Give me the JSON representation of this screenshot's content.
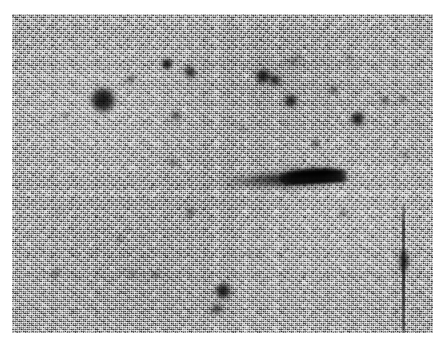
{
  "figure": {
    "kind": "astronomical-photographic-plate",
    "width": 445,
    "height": 348,
    "paper_color": "#ffffff"
  },
  "plate": {
    "left": 12,
    "top": 14,
    "width": 421,
    "height": 319,
    "background_color": "#9a9a9a",
    "grain_dark": "#4f4f4f",
    "grain_light": "#ececec",
    "source_color": "#161616"
  },
  "streak_object": {
    "name": "elongated-dark-object",
    "center_x": 283,
    "center_y": 179,
    "length": 128,
    "height": 26,
    "rotation_deg": -3,
    "core_color": "#0a0a0a"
  },
  "scratch": {
    "name": "plate-scratch",
    "x": 402,
    "top": 203,
    "width": 3,
    "height": 133,
    "knot_y": 58,
    "knot_width": 11,
    "knot_height": 24
  },
  "stars": [
    {
      "id": "star-01",
      "x": 103,
      "y": 100,
      "r": 12.5,
      "darkness": 0.93,
      "blur": 2.2
    },
    {
      "id": "star-02",
      "x": 131,
      "y": 79,
      "r": 4.0,
      "darkness": 0.62,
      "blur": 2.0
    },
    {
      "id": "star-03",
      "x": 167,
      "y": 64,
      "r": 5.6,
      "darkness": 0.88,
      "blur": 1.8
    },
    {
      "id": "star-04",
      "x": 190,
      "y": 72,
      "r": 5.8,
      "darkness": 0.84,
      "blur": 2.0
    },
    {
      "id": "star-05",
      "x": 176,
      "y": 116,
      "r": 4.6,
      "darkness": 0.7,
      "blur": 2.0
    },
    {
      "id": "star-06",
      "x": 263,
      "y": 76,
      "r": 7.4,
      "darkness": 0.92,
      "blur": 2.0
    },
    {
      "id": "star-07",
      "x": 275,
      "y": 80,
      "r": 6.2,
      "darkness": 0.86,
      "blur": 2.2
    },
    {
      "id": "star-08",
      "x": 293,
      "y": 62,
      "r": 3.6,
      "darkness": 0.6,
      "blur": 2.0
    },
    {
      "id": "star-09",
      "x": 291,
      "y": 101,
      "r": 6.6,
      "darkness": 0.88,
      "blur": 2.0
    },
    {
      "id": "star-10",
      "x": 334,
      "y": 90,
      "r": 4.2,
      "darkness": 0.64,
      "blur": 2.2
    },
    {
      "id": "star-11",
      "x": 358,
      "y": 119,
      "r": 7.2,
      "darkness": 0.9,
      "blur": 2.0
    },
    {
      "id": "star-12",
      "x": 385,
      "y": 100,
      "r": 3.8,
      "darkness": 0.62,
      "blur": 2.0
    },
    {
      "id": "star-13",
      "x": 403,
      "y": 99,
      "r": 3.4,
      "darkness": 0.55,
      "blur": 2.2
    },
    {
      "id": "star-14",
      "x": 316,
      "y": 143,
      "r": 3.6,
      "darkness": 0.66,
      "blur": 2.0
    },
    {
      "id": "star-15",
      "x": 406,
      "y": 155,
      "r": 3.2,
      "darkness": 0.58,
      "blur": 2.0
    },
    {
      "id": "star-16",
      "x": 173,
      "y": 163,
      "r": 3.6,
      "darkness": 0.62,
      "blur": 2.0
    },
    {
      "id": "star-17",
      "x": 190,
      "y": 212,
      "r": 4.0,
      "darkness": 0.68,
      "blur": 2.0
    },
    {
      "id": "star-18",
      "x": 343,
      "y": 213,
      "r": 3.4,
      "darkness": 0.58,
      "blur": 2.2
    },
    {
      "id": "star-19",
      "x": 223,
      "y": 291,
      "r": 8.0,
      "darkness": 0.92,
      "blur": 2.0
    },
    {
      "id": "star-20",
      "x": 217,
      "y": 309,
      "r": 5.6,
      "darkness": 0.8,
      "blur": 2.4
    },
    {
      "id": "star-21",
      "x": 56,
      "y": 273,
      "r": 3.4,
      "darkness": 0.55,
      "blur": 2.2
    },
    {
      "id": "star-22",
      "x": 133,
      "y": 273,
      "r": 3.2,
      "darkness": 0.52,
      "blur": 2.2
    },
    {
      "id": "star-23",
      "x": 156,
      "y": 275,
      "r": 3.6,
      "darkness": 0.58,
      "blur": 2.2
    },
    {
      "id": "star-24",
      "x": 66,
      "y": 115,
      "r": 2.8,
      "darkness": 0.48,
      "blur": 2.2
    },
    {
      "id": "star-25",
      "x": 120,
      "y": 240,
      "r": 2.8,
      "darkness": 0.45,
      "blur": 2.2
    },
    {
      "id": "star-26",
      "x": 243,
      "y": 128,
      "r": 2.8,
      "darkness": 0.45,
      "blur": 2.2
    },
    {
      "id": "star-27",
      "x": 349,
      "y": 58,
      "r": 3.0,
      "darkness": 0.5,
      "blur": 2.2
    },
    {
      "id": "star-28",
      "x": 298,
      "y": 57,
      "r": 2.8,
      "darkness": 0.46,
      "blur": 2.2
    },
    {
      "id": "star-29",
      "x": 60,
      "y": 210,
      "r": 2.6,
      "darkness": 0.42,
      "blur": 2.2
    },
    {
      "id": "star-30",
      "x": 250,
      "y": 255,
      "r": 2.6,
      "darkness": 0.42,
      "blur": 2.2
    }
  ]
}
